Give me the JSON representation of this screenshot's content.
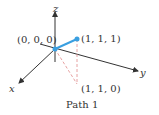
{
  "diagram": {
    "caption": "Path 1",
    "axes": {
      "x": "x",
      "y": "y",
      "z": "z"
    },
    "points": {
      "origin": "(0, 0, 0)",
      "p111": "(1, 1, 1)",
      "p110": "(1, 1, 0)"
    },
    "colors": {
      "path": "#3a9fe0",
      "dashed": "#e08a8a",
      "axis": "#333333"
    }
  }
}
